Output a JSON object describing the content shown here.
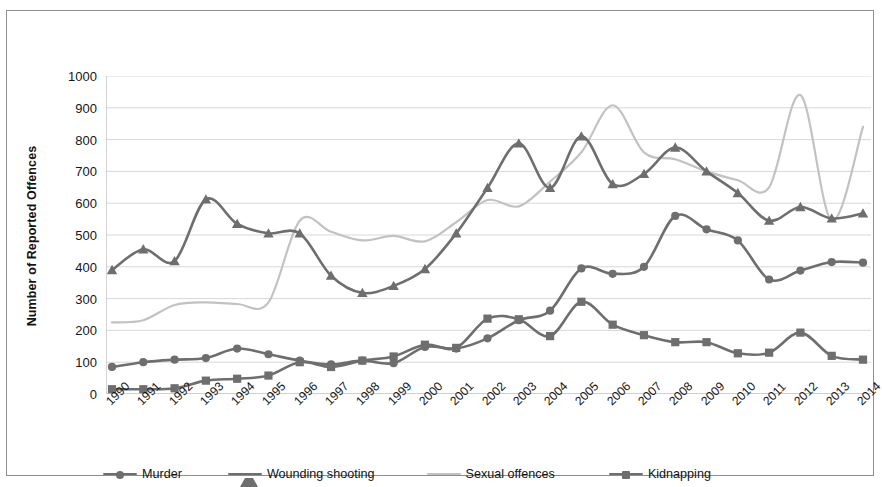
{
  "chart_data": {
    "type": "line",
    "title": "",
    "subtitle": "",
    "xlabel": "",
    "ylabel": "Number of Reported Offences",
    "ylim": [
      0,
      1000
    ],
    "ytick_step": 100,
    "yticks": [
      "1000",
      "900",
      "800",
      "700",
      "600",
      "500",
      "400",
      "300",
      "200",
      "100",
      "0"
    ],
    "grid": true,
    "grid_axis": "y",
    "legend_position": "bottom",
    "smoothing": "spline",
    "categories": [
      "1990",
      "1991",
      "1992",
      "1993",
      "1994",
      "1995",
      "1996",
      "1997",
      "1998",
      "1999",
      "2000",
      "2001",
      "2002",
      "2003",
      "2004",
      "2005",
      "2006",
      "2007",
      "2008",
      "2009",
      "2010",
      "2011",
      "2012",
      "2013",
      "2014"
    ],
    "series": [
      {
        "name": "Murder",
        "marker": "circle",
        "color": "#6e6e6e",
        "values": [
          85,
          100,
          108,
          113,
          143,
          125,
          105,
          93,
          105,
          97,
          148,
          143,
          175,
          232,
          262,
          395,
          378,
          400,
          560,
          518,
          483,
          360,
          388,
          415,
          413
        ]
      },
      {
        "name": "Wounding shooting",
        "marker": "triangle",
        "color": "#6e6e6e",
        "values": [
          390,
          455,
          418,
          612,
          535,
          505,
          505,
          372,
          318,
          340,
          393,
          505,
          648,
          788,
          648,
          810,
          660,
          692,
          775,
          700,
          632,
          545,
          588,
          552,
          568
        ]
      },
      {
        "name": "Sexual offences",
        "marker": "none",
        "color": "#c2c2c2",
        "values": [
          225,
          232,
          280,
          288,
          283,
          288,
          545,
          510,
          483,
          497,
          480,
          540,
          610,
          590,
          668,
          760,
          908,
          760,
          738,
          700,
          672,
          650,
          940,
          545,
          840
        ]
      },
      {
        "name": "Kidnapping",
        "marker": "square",
        "color": "#6e6e6e",
        "values": [
          15,
          15,
          18,
          42,
          48,
          58,
          100,
          85,
          105,
          118,
          155,
          145,
          237,
          235,
          182,
          290,
          218,
          185,
          163,
          163,
          128,
          130,
          193,
          120,
          108
        ]
      }
    ]
  },
  "legend": {
    "items": [
      {
        "label": "Murder",
        "marker": "circle",
        "color": "#6e6e6e"
      },
      {
        "label": "Wounding shooting",
        "marker": "triangle",
        "color": "#6e6e6e"
      },
      {
        "label": "Sexual offences",
        "marker": "none",
        "color": "#c2c2c2"
      },
      {
        "label": "Kidnapping",
        "marker": "square",
        "color": "#6e6e6e"
      }
    ]
  },
  "colors": {
    "dark_series": "#6e6e6e",
    "light_series": "#c2c2c2",
    "gridline": "#d8d8d8",
    "axis": "#b4b4b4",
    "border": "#8d8d8d",
    "text": "#171717"
  }
}
